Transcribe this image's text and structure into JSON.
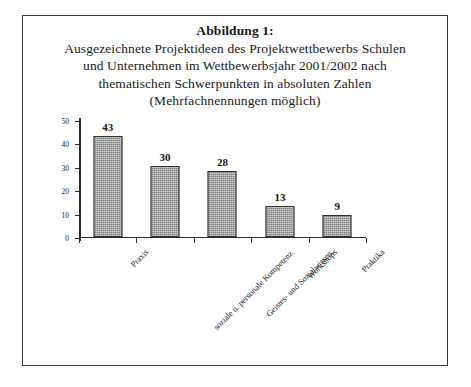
{
  "figure": {
    "caption_lines": [
      "Abbildung 1:",
      "Ausgezeichnete Projektideen des Projektwettbewerbs Schulen",
      "und Unternehmen im Wettbewerbsjahr 2001/2002 nach",
      "thematischen Schwerpunkten in absoluten Zahlen",
      "(Mehrfachnennungen möglich)"
    ]
  },
  "chart_data": {
    "type": "bar",
    "categories": [
      "Praxis",
      "soziale u. personale Kompetenz.",
      "Geistes- und Sozialwissen.",
      "Workshops",
      "Praktika"
    ],
    "values": [
      43,
      30,
      28,
      13,
      9
    ],
    "xlabel": "",
    "ylabel": "",
    "ylim": [
      0,
      50
    ],
    "yticks": [
      0,
      10,
      20,
      30,
      40,
      50
    ],
    "ytick_labels": [
      "0",
      "10",
      "20",
      "30",
      "40",
      "50"
    ],
    "grid": false,
    "legend": false,
    "data_labels": [
      "43",
      "30",
      "28",
      "13",
      "9"
    ],
    "bar_color": "#a3a3a3",
    "bar_edge_color": "#2f2f2f",
    "axis_color": "#2b2b2b"
  }
}
